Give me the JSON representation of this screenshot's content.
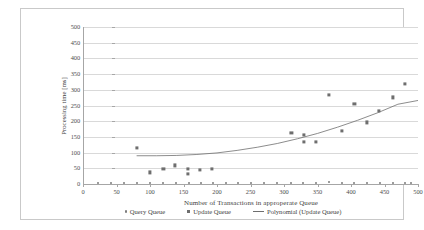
{
  "chart_data": {
    "type": "scatter",
    "title": "",
    "xlabel": "Number of Transactions in approperate Queue",
    "ylabel": "Processing time [ms]",
    "xlim": [
      0,
      500
    ],
    "ylim": [
      0,
      500
    ],
    "xticks": [
      0,
      50,
      100,
      150,
      200,
      250,
      300,
      350,
      400,
      450,
      500
    ],
    "yticks": [
      0,
      50,
      100,
      150,
      200,
      250,
      300,
      350,
      400,
      450,
      500
    ],
    "grid": "horizontal",
    "legend_position": "bottom",
    "series": [
      {
        "name": "Query Queue",
        "type": "scatter",
        "marker": "dot",
        "color": "#7d7d7d",
        "points": [
          [
            22,
            2
          ],
          [
            42,
            2
          ],
          [
            61,
            2
          ],
          [
            80,
            2
          ],
          [
            100,
            3
          ],
          [
            120,
            2
          ],
          [
            139,
            2
          ],
          [
            158,
            2
          ],
          [
            176,
            2
          ],
          [
            194,
            2
          ],
          [
            213,
            2
          ],
          [
            232,
            2
          ],
          [
            251,
            2
          ],
          [
            270,
            2
          ],
          [
            290,
            2
          ],
          [
            310,
            4
          ],
          [
            329,
            2
          ],
          [
            348,
            2
          ],
          [
            367,
            5
          ],
          [
            386,
            2
          ],
          [
            405,
            2
          ],
          [
            424,
            2
          ],
          [
            443,
            2
          ],
          [
            462,
            2
          ],
          [
            481,
            2
          ],
          [
            490,
            2
          ]
        ]
      },
      {
        "name": "Update Queue",
        "type": "scatter",
        "marker": "square",
        "color": "#6e6e6e",
        "points": [
          [
            80,
            115
          ],
          [
            100,
            37
          ],
          [
            120,
            49
          ],
          [
            137,
            59
          ],
          [
            157,
            49
          ],
          [
            157,
            33
          ],
          [
            175,
            44
          ],
          [
            192,
            49
          ],
          [
            311,
            164
          ],
          [
            330,
            156
          ],
          [
            330,
            134
          ],
          [
            348,
            134
          ],
          [
            367,
            284
          ],
          [
            386,
            170
          ],
          [
            405,
            256
          ],
          [
            424,
            196
          ],
          [
            442,
            232
          ],
          [
            462,
            276
          ],
          [
            481,
            320
          ]
        ]
      },
      {
        "name": "Polynomial (Update Queue)",
        "type": "line",
        "color": "#6e6e6e",
        "points": [
          [
            80,
            90
          ],
          [
            110,
            90
          ],
          [
            140,
            91
          ],
          [
            170,
            94
          ],
          [
            200,
            99
          ],
          [
            230,
            107
          ],
          [
            260,
            117
          ],
          [
            290,
            129
          ],
          [
            320,
            144
          ],
          [
            350,
            161
          ],
          [
            380,
            181
          ],
          [
            410,
            203
          ],
          [
            440,
            227
          ],
          [
            470,
            254
          ],
          [
            500,
            266
          ]
        ]
      }
    ]
  },
  "legend": {
    "items": [
      {
        "label": "Query Queue",
        "marker": "dot"
      },
      {
        "label": "Update Queue",
        "marker": "square"
      },
      {
        "label": "Polynomial (Update Queue)",
        "marker": "line"
      }
    ]
  }
}
